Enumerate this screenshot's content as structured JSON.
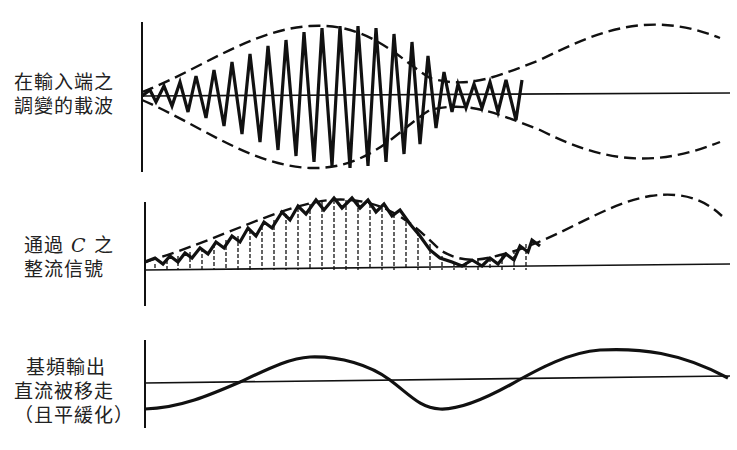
{
  "panels": [
    {
      "id": "modulated-carrier",
      "label_lines": [
        "在輸入端之",
        "調變的載波"
      ]
    },
    {
      "id": "rectified-signal",
      "label_lines": [
        "通過",
        "C",
        "之",
        "整流信號"
      ]
    },
    {
      "id": "baseband-output",
      "label_lines": [
        "基頻輸出",
        "直流被移走",
        "（且平緩化）"
      ]
    }
  ]
}
